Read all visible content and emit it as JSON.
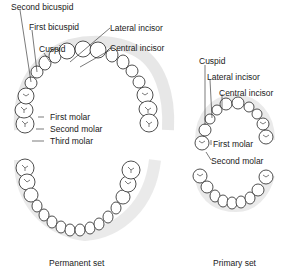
{
  "permanent_set": {
    "caption": "Permanent set",
    "labels": {
      "second_bicuspid": "Second bicuspid",
      "first_bicuspid": "First bicuspid",
      "cuspid": "Cuspid",
      "lateral_incisor": "Lateral incisor",
      "central_incisor": "Central incisor",
      "first_molar": "First molar",
      "second_molar": "Second molar",
      "third_molar": "Third molar"
    }
  },
  "primary_set": {
    "caption": "Primary set",
    "labels": {
      "cuspid": "Cuspid",
      "lateral_incisor": "Lateral incisor",
      "central_incisor": "Central incisor",
      "first_molar": "First molar",
      "second_molar": "Second molar"
    }
  }
}
